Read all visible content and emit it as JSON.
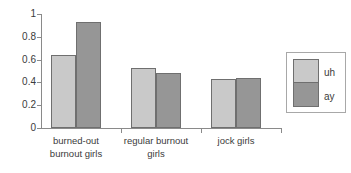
{
  "chart_data": {
    "type": "bar",
    "title": "",
    "xlabel": "",
    "ylabel": "",
    "ylim": [
      0,
      1
    ],
    "grid": false,
    "legend_position": "right",
    "categories": [
      "burned-out\nburnout girls",
      "regular burnout\ngirls",
      "jock girls"
    ],
    "series": [
      {
        "name": "uh",
        "color": "#c9c9c9",
        "values": [
          0.64,
          0.53,
          0.43
        ]
      },
      {
        "name": "ay",
        "color": "#969696",
        "values": [
          0.93,
          0.48,
          0.44
        ]
      }
    ],
    "yticks": [
      0,
      0.2,
      0.4,
      0.6,
      0.8,
      1
    ],
    "ytick_labels": [
      "0",
      "0.2",
      "0.4",
      "0.6",
      "0.8",
      "1"
    ]
  },
  "axis": {
    "y_labels": {
      "t0": "0",
      "t1": "0.2",
      "t2": "0.4",
      "t3": "0.6",
      "t4": "0.8",
      "t5": "1"
    }
  },
  "categories": {
    "c0": "burned-out\nburnout girls",
    "c1": "regular burnout\ngirls",
    "c2": "jock girls"
  },
  "legend": {
    "entries": [
      {
        "label": "uh",
        "color": "#c9c9c9"
      },
      {
        "label": "ay",
        "color": "#969696"
      }
    ],
    "label_uh": "uh",
    "label_ay": "ay"
  }
}
